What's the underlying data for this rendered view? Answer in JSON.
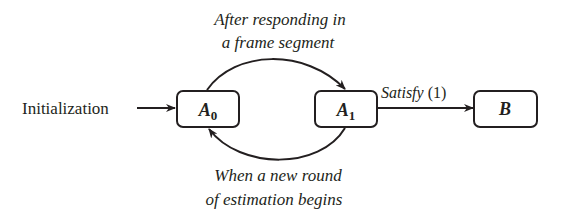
{
  "diagram": {
    "type": "state-transition",
    "colors": {
      "stroke": "#231f20",
      "text": "#231f20",
      "background": "#ffffff"
    },
    "entry": {
      "label": "Initialization"
    },
    "nodes": [
      {
        "id": "A0",
        "base": "A",
        "sub": "0"
      },
      {
        "id": "A1",
        "base": "A",
        "sub": "1"
      },
      {
        "id": "B",
        "base": "B",
        "sub": ""
      }
    ],
    "edges": {
      "a0_to_a1": {
        "line1": "After responding in",
        "line2": "a frame segment"
      },
      "a1_to_a0": {
        "line1": "When a new round",
        "line2": "of estimation begins"
      },
      "a1_to_b": {
        "italic": "Satisfy",
        "plain": " (1)"
      }
    }
  }
}
